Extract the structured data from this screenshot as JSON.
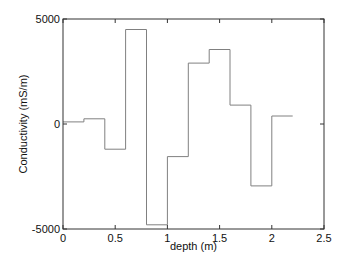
{
  "chart_data": {
    "type": "line",
    "style": "step",
    "title": "",
    "xlabel": "depth (m)",
    "ylabel": "Conductivity (mS/m)",
    "xlim": [
      0,
      2.5
    ],
    "ylim": [
      -5000,
      5000
    ],
    "xticks": [
      0,
      0.5,
      1,
      1.5,
      2,
      2.5
    ],
    "xtick_labels": [
      "0",
      "0.5",
      "1",
      "1.5",
      "2",
      "2.5"
    ],
    "yticks": [
      -5000,
      0,
      5000
    ],
    "ytick_labels": [
      "-5000",
      "0",
      "5000"
    ],
    "grid": false,
    "legend": null,
    "series": [
      {
        "name": "conductivity",
        "color": "#808080",
        "steps": [
          {
            "x0": 0.0,
            "x1": 0.2,
            "y": 100
          },
          {
            "x0": 0.2,
            "x1": 0.4,
            "y": 250
          },
          {
            "x0": 0.4,
            "x1": 0.6,
            "y": -1200
          },
          {
            "x0": 0.6,
            "x1": 0.8,
            "y": 4500
          },
          {
            "x0": 0.8,
            "x1": 1.0,
            "y": -4800
          },
          {
            "x0": 1.0,
            "x1": 1.2,
            "y": -1550
          },
          {
            "x0": 1.2,
            "x1": 1.4,
            "y": 2900
          },
          {
            "x0": 1.4,
            "x1": 1.6,
            "y": 3550
          },
          {
            "x0": 1.6,
            "x1": 1.8,
            "y": 900
          },
          {
            "x0": 1.8,
            "x1": 2.0,
            "y": -2950
          },
          {
            "x0": 2.0,
            "x1": 2.2,
            "y": 380
          }
        ]
      }
    ]
  }
}
